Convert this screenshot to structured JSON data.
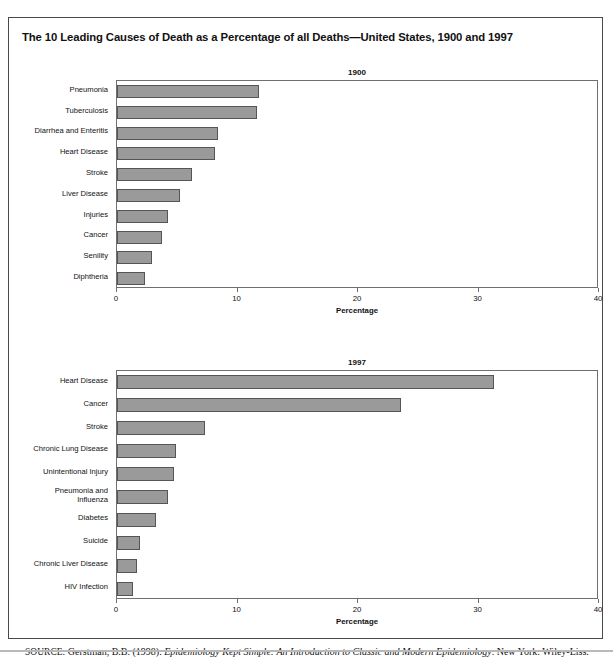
{
  "figure": {
    "caption": "FIGURE 1",
    "title": "The 10 Leading Causes of Death as a Percentage of all Deaths—United States, 1900 and 1997",
    "source_prefix": "SOURCE:",
    "source_author": "Gerstman, B.B. (1998).",
    "source_work": "Epidemiology Kept Simple: An Introduction to Classic and Modern Epidemiology",
    "source_publisher": ". New York: Wiley-Liss."
  },
  "colors": {
    "bar_fill": "#9a9a9a",
    "bar_border": "#555555",
    "frame": "#4a4a4a",
    "axis": "#6f6f6f"
  },
  "chart_data": [
    {
      "type": "bar",
      "orientation": "horizontal",
      "title": "1900",
      "xlabel": "Percentage",
      "ylabel": "",
      "xlim": [
        0,
        40
      ],
      "xticks": [
        0,
        10,
        20,
        30,
        40
      ],
      "xticklabels": [
        "0",
        "10",
        "20",
        "30",
        "40"
      ],
      "grid": false,
      "legend": false,
      "categories": [
        "Pneumonia",
        "Tuberculosis",
        "Diarrhea and Enteritis",
        "Heart Disease",
        "Stroke",
        "Liver Disease",
        "Injuries",
        "Cancer",
        "Senility",
        "Diphtheria"
      ],
      "values": [
        11.8,
        11.6,
        8.4,
        8.1,
        6.2,
        5.2,
        4.2,
        3.7,
        2.9,
        2.3
      ]
    },
    {
      "type": "bar",
      "orientation": "horizontal",
      "title": "1997",
      "xlabel": "Percentage",
      "ylabel": "",
      "xlim": [
        0,
        40
      ],
      "xticks": [
        0,
        10,
        20,
        30,
        40
      ],
      "xticklabels": [
        "0",
        "10",
        "20",
        "30",
        "40"
      ],
      "grid": false,
      "legend": false,
      "categories": [
        "Heart Disease",
        "Cancer",
        "Stroke",
        "Chronic Lung Disease",
        "Unintentional Injury",
        "Pneumonia and\nInfluenza",
        "Diabetes",
        "Suicide",
        "Chronic Liver Disease",
        "HIV Infection"
      ],
      "values": [
        31.3,
        23.6,
        7.3,
        4.9,
        4.7,
        4.2,
        3.2,
        1.9,
        1.7,
        1.3
      ]
    }
  ]
}
